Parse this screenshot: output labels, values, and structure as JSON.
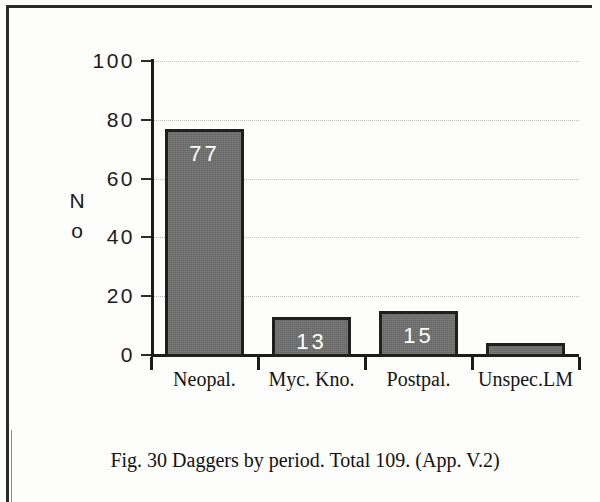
{
  "figure": {
    "caption": "Fig. 30   Daggers  by  period. Total 109. (App. V.2)"
  },
  "axis": {
    "y_title_line1": "N",
    "y_title_line2": "o"
  },
  "colors": {
    "bar_fill": "#6f6f6f",
    "bar_outline": "#1f1f1f",
    "bar_label": "#ffffff",
    "axis": "#1b1b1b",
    "gridline": "#bdbdbd",
    "frame": "#2a2a2a",
    "page_background": "#fdfdfc"
  },
  "chart_data": {
    "type": "bar",
    "title": "Fig. 30   Daggers  by  period. Total 109. (App. V.2)",
    "xlabel": "",
    "ylabel": "No",
    "categories": [
      "Neopal.",
      "Myc. Kno.",
      "Postpal.",
      "Unspec.LM"
    ],
    "values": [
      77,
      13,
      15,
      4
    ],
    "bar_labels": [
      "77",
      "13",
      "15",
      ""
    ],
    "total": 109,
    "ylim": [
      0,
      100
    ],
    "yticks": [
      0,
      20,
      40,
      60,
      80,
      100
    ],
    "ytick_labels": [
      "0",
      "20",
      "40",
      "60",
      "80",
      "100"
    ],
    "grid": true,
    "grid_style": "dotted",
    "legend": false
  }
}
